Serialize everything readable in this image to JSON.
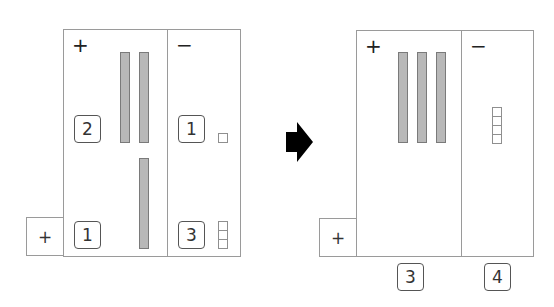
{
  "diagram": {
    "type": "place-value subtraction/regrouping illustration",
    "colors": {
      "rod_fill": "#b8b8b8",
      "rod_border": "#7a7a7a",
      "line": "#9a9a9a",
      "arrow": "#000000"
    },
    "before": {
      "plus_label": "+",
      "minus_label": "−",
      "side_label": "+",
      "plus_column": {
        "rows": [
          {
            "count_label": "2",
            "rods": 2
          },
          {
            "count_label": "1",
            "rods": 1
          }
        ]
      },
      "minus_column": {
        "rows": [
          {
            "count_label": "1",
            "units": 1
          },
          {
            "count_label": "3",
            "units": 3
          }
        ]
      }
    },
    "arrow": "right-arrow",
    "after": {
      "plus_label": "+",
      "minus_label": "−",
      "side_label": "+",
      "plus_column": {
        "rods": 3,
        "result_label": "3"
      },
      "minus_column": {
        "units": 4,
        "result_label": "4"
      }
    }
  }
}
